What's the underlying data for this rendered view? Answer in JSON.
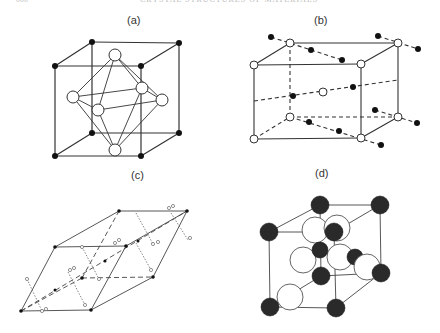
{
  "header": {
    "page_number": "000",
    "running_title": "CRYSTAL STRUCTURES OF MATERIALS"
  },
  "panels": [
    {
      "id": "a",
      "label": "(a)",
      "description": "Cubic cell with black corner atoms and an octahedron of open atoms at face centers"
    },
    {
      "id": "b",
      "label": "(b)",
      "description": "Rectangular prism cell with open atoms at corners and chains of black atoms along dashed lines"
    },
    {
      "id": "c",
      "label": "(c)",
      "description": "Rhombohedral cell with small black atoms and dotted open-atom pairs"
    },
    {
      "id": "d",
      "label": "(d)",
      "description": "Face-centered cubic cell with dark shaded atoms and large open atoms"
    }
  ],
  "colors": {
    "line": "#333333",
    "black_atom": "#111111",
    "open_atom_fill": "#ffffff",
    "shaded_atom": "#2a2a2a"
  }
}
